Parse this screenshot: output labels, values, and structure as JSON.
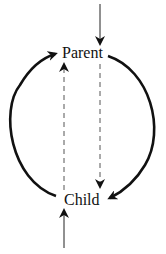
{
  "diagram": {
    "type": "cycle",
    "nodes": [
      {
        "id": "parent",
        "label": "Parent"
      },
      {
        "id": "child",
        "label": "Child"
      }
    ],
    "edges": [
      {
        "from": "parent",
        "to": "child",
        "style": "solid-thick",
        "route": "right-arc"
      },
      {
        "from": "child",
        "to": "parent",
        "style": "solid-thick",
        "route": "left-arc"
      },
      {
        "from": "parent",
        "to": "child",
        "style": "dashed",
        "route": "straight-right"
      },
      {
        "from": "child",
        "to": "parent",
        "style": "dashed",
        "route": "straight-left"
      },
      {
        "from": "external-top",
        "to": "parent",
        "style": "solid-thin",
        "route": "incoming-from-top"
      },
      {
        "from": "external-bottom",
        "to": "child",
        "style": "solid-thin",
        "route": "incoming-from-bottom"
      }
    ],
    "colors": {
      "stroke": "#111111",
      "dashed": "#444444",
      "background": "#ffffff"
    }
  }
}
